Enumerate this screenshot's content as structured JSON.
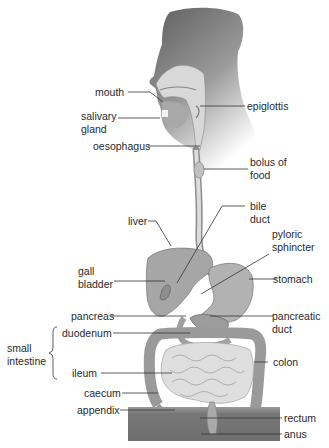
{
  "diagram": {
    "colors": {
      "head_dark": "#6b6b6b",
      "head_light": "#d9d9d9",
      "organ_mid": "#a8a8a8",
      "organ_light": "#c9c9c9",
      "intestine_light": "#dedede",
      "pelvis": "#7a7a7a",
      "leader_line": "#333333"
    },
    "labels": [
      {
        "id": "mouth",
        "text": "mouth"
      },
      {
        "id": "salivary_gland",
        "text": "salivary\ngland"
      },
      {
        "id": "oesophagus",
        "text": "oesophagus"
      },
      {
        "id": "epiglottis",
        "text": "epiglottis"
      },
      {
        "id": "bolus_of_food",
        "text": "bolus of\nfood"
      },
      {
        "id": "bile_duct",
        "text": "bile\nduct"
      },
      {
        "id": "liver",
        "text": "liver"
      },
      {
        "id": "pyloric_sphincter",
        "text": "pyloric\nsphincter"
      },
      {
        "id": "gall_bladder",
        "text": "gall\nbladder"
      },
      {
        "id": "stomach",
        "text": "stomach"
      },
      {
        "id": "pancreas",
        "text": "pancreas"
      },
      {
        "id": "pancreatic_duct",
        "text": "pancreatic\nduct"
      },
      {
        "id": "small_intestine",
        "text": "small\nintestine"
      },
      {
        "id": "duodenum",
        "text": "duodenum"
      },
      {
        "id": "ileum",
        "text": "ileum"
      },
      {
        "id": "colon",
        "text": "colon"
      },
      {
        "id": "caecum",
        "text": "caecum"
      },
      {
        "id": "appendix",
        "text": "appendix"
      },
      {
        "id": "rectum",
        "text": "rectum"
      },
      {
        "id": "anus",
        "text": "anus"
      }
    ]
  }
}
